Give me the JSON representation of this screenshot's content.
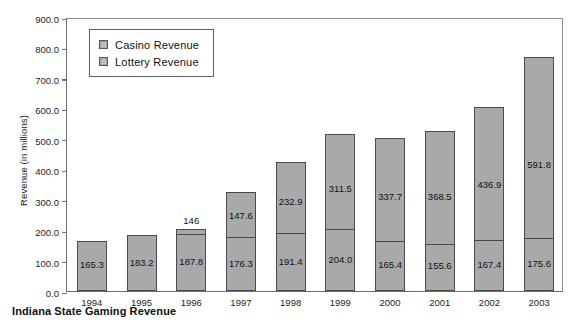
{
  "caption": "Indiana State Gaming Revenue",
  "legend": {
    "position": "top-left-inside",
    "items": [
      {
        "label": "Casino Revenue",
        "key": "casino",
        "color": "#a9a9a9"
      },
      {
        "label": "Lottery Revenue",
        "key": "lottery",
        "color": "#a9a9a9"
      }
    ]
  },
  "axes": {
    "ylabel": "Revenue (in millions)",
    "yticks": [
      "0.0",
      "100.0",
      "200.0",
      "300.0",
      "400.0",
      "500.0",
      "600.0",
      "700.0",
      "800.0",
      "900.0"
    ],
    "xticks": [
      "1994",
      "1995",
      "1996",
      "1997",
      "1998",
      "1999",
      "2000",
      "2001",
      "2002",
      "2003"
    ]
  },
  "chart_data": {
    "type": "bar",
    "stacked": true,
    "title": "Indiana State Gaming Revenue",
    "xlabel": "",
    "ylabel": "Revenue (in millions)",
    "ylim": [
      0,
      900
    ],
    "ytick_step": 100,
    "grid": false,
    "legend_position": "upper left",
    "categories": [
      "1994",
      "1995",
      "1996",
      "1997",
      "1998",
      "1999",
      "2000",
      "2001",
      "2002",
      "2003"
    ],
    "series": [
      {
        "name": "Lottery Revenue",
        "values": [
          165.3,
          183.2,
          187.8,
          176.3,
          191.4,
          204.0,
          165.4,
          155.6,
          167.4,
          175.6
        ],
        "labels": [
          "165.3",
          "183.2",
          "187.8",
          "176.3",
          "191.4",
          "204.0",
          "165.4",
          "155.6",
          "167.4",
          "175.6"
        ],
        "color": "#a9a9a9"
      },
      {
        "name": "Casino Revenue",
        "values": [
          0,
          0,
          14.6,
          147.6,
          232.9,
          311.5,
          337.7,
          368.5,
          436.9,
          591.8
        ],
        "labels": [
          "",
          "",
          "146",
          "147.6",
          "232.9",
          "311.5",
          "337.7",
          "368.5",
          "436.9",
          "591.8"
        ],
        "color": "#a9a9a9"
      }
    ],
    "totals": [
      165.3,
      183.2,
      202.4,
      323.9,
      424.3,
      515.5,
      503.1,
      524.1,
      604.3,
      767.4
    ]
  }
}
